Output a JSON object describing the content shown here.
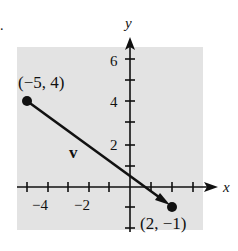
{
  "figure": {
    "axis_x_label": "x",
    "axis_y_label": "y",
    "vector_label": "v",
    "start_point": {
      "label": "(−5, 4)",
      "x": -5,
      "y": 4
    },
    "end_point": {
      "label": "(2, −1)",
      "x": 2,
      "y": -1
    },
    "x_tick_labels": [
      "−4",
      "−2"
    ],
    "y_tick_labels": [
      "6",
      "4",
      "2"
    ],
    "background_color": "#e3e3e3",
    "ink_color": "#111111"
  }
}
